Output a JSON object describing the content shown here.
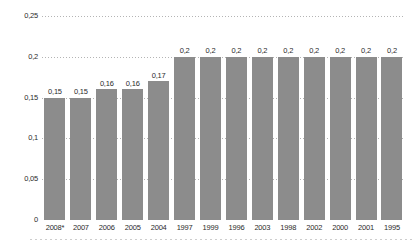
{
  "chart_data": {
    "type": "bar",
    "title": "",
    "categories": [
      "2008*",
      "2007",
      "2006",
      "2005",
      "2004",
      "1997",
      "1999",
      "1996",
      "2003",
      "1998",
      "2002",
      "2000",
      "2001",
      "1995"
    ],
    "values": [
      0.15,
      0.15,
      0.16,
      0.16,
      0.17,
      0.2,
      0.2,
      0.2,
      0.2,
      0.2,
      0.2,
      0.2,
      0.2,
      0.2
    ],
    "value_labels": [
      "0,15",
      "0,15",
      "0,16",
      "0,16",
      "0,17",
      "0,2",
      "0,2",
      "0,2",
      "0,2",
      "0,2",
      "0,2",
      "0,2",
      "0,2",
      "0,2"
    ],
    "xlabel": "",
    "ylabel": "",
    "ylim": [
      0,
      0.25
    ],
    "yticks": [
      {
        "label": "0,25",
        "value": 0.25
      },
      {
        "label": "0,2",
        "value": 0.2
      },
      {
        "label": "0,15",
        "value": 0.15
      },
      {
        "label": "0,1",
        "value": 0.1
      },
      {
        "label": "0,05",
        "value": 0.05
      },
      {
        "label": "0",
        "value": 0
      }
    ],
    "grid": "dotted-horizontal",
    "legend": "none",
    "colors": {
      "bar": "#8c8c8c",
      "grid": "#b4b4b4",
      "text": "#2b2b2b",
      "separator": "#cdcdcd",
      "background": "#ffffff"
    }
  }
}
